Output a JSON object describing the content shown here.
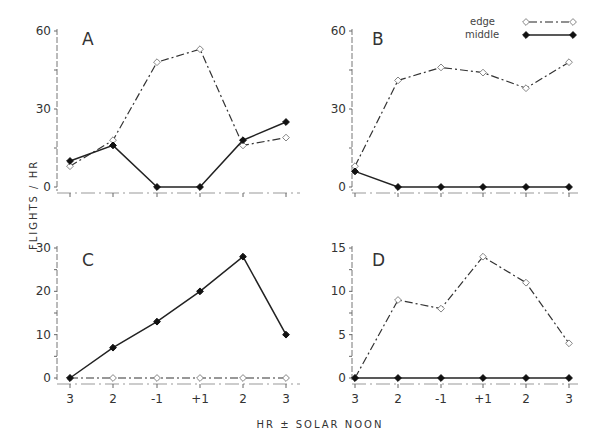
{
  "chart_data": {
    "type": "line",
    "ylabel": "FLIGHTS / HR",
    "xlabel": "HR ± SOLAR NOON",
    "x": [
      "3",
      "2",
      "-1",
      "+1",
      "2",
      "3"
    ],
    "legend": [
      {
        "name": "edge",
        "marker": "open-diamond",
        "line": "dash-dot"
      },
      {
        "name": "middle",
        "marker": "filled-diamond",
        "line": "solid"
      }
    ],
    "legend_position": "top-right",
    "panels": [
      {
        "label": "A",
        "ylim": [
          0,
          60
        ],
        "yticks": [
          "0",
          "30",
          "60"
        ],
        "series": [
          {
            "name": "edge",
            "values": [
              8,
              18,
              48,
              53,
              16,
              19
            ]
          },
          {
            "name": "middle",
            "values": [
              10,
              16,
              0,
              0,
              18,
              25
            ]
          }
        ]
      },
      {
        "label": "B",
        "ylim": [
          0,
          60
        ],
        "yticks": [
          "0",
          "30",
          "60"
        ],
        "series": [
          {
            "name": "edge",
            "values": [
              8,
              41,
              46,
              44,
              38,
              48
            ]
          },
          {
            "name": "middle",
            "values": [
              6,
              0,
              0,
              0,
              0,
              0
            ]
          }
        ]
      },
      {
        "label": "C",
        "ylim": [
          0,
          30
        ],
        "yticks": [
          "0",
          "10",
          "20",
          "30"
        ],
        "series": [
          {
            "name": "edge",
            "values": [
              0,
              0,
              0,
              0,
              0,
              0
            ]
          },
          {
            "name": "middle",
            "values": [
              0,
              7,
              13,
              20,
              28,
              10
            ]
          }
        ]
      },
      {
        "label": "D",
        "ylim": [
          0,
          15
        ],
        "yticks": [
          "0",
          "5",
          "10",
          "15"
        ],
        "series": [
          {
            "name": "edge",
            "values": [
              0,
              9,
              8,
              14,
              11,
              4
            ]
          },
          {
            "name": "middle",
            "values": [
              0,
              0,
              0,
              0,
              0,
              0
            ]
          }
        ]
      }
    ]
  }
}
